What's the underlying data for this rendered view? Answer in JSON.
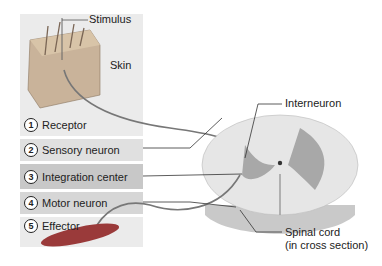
{
  "diagram": {
    "labels": {
      "stimulus": "Stimulus",
      "skin": "Skin",
      "interneuron": "Interneuron",
      "spinal_cord_line1": "Spinal cord",
      "spinal_cord_line2": "(in cross section)"
    },
    "steps": [
      {
        "num": "1",
        "label": "Receptor"
      },
      {
        "num": "2",
        "label": "Sensory neuron"
      },
      {
        "num": "3",
        "label": "Integration center"
      },
      {
        "num": "4",
        "label": "Motor neuron"
      },
      {
        "num": "5",
        "label": "Effector"
      }
    ],
    "colors": {
      "panel": "#ebebeb",
      "integration_row": "#c8c8c8",
      "grey_matter": "#a8a8a8",
      "white_matter": "#e6e6e6"
    }
  }
}
